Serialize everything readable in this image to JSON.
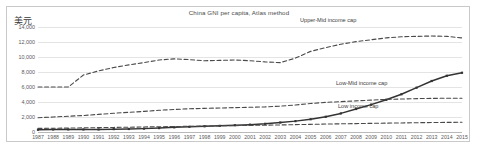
{
  "chart_data": {
    "type": "line",
    "title": "China GNI per capita, Atlas method",
    "xlabel": "",
    "ylabel": "美元",
    "ylim": [
      0,
      14000
    ],
    "ytick_labels": [
      "14,000",
      "12,000",
      "10,000",
      "8,000",
      "6,000",
      "4,000",
      "2,000",
      "0"
    ],
    "ytick_values": [
      14000,
      12000,
      10000,
      8000,
      6000,
      4000,
      2000,
      0
    ],
    "grid": true,
    "legend_position": "inline-annotations",
    "categories": [
      "1987",
      "1988",
      "1989",
      "1990",
      "1991",
      "1992",
      "1993",
      "1994",
      "1995",
      "1996",
      "1997",
      "1998",
      "1999",
      "2000",
      "2001",
      "2002",
      "2003",
      "2004",
      "2005",
      "2006",
      "2007",
      "2008",
      "2009",
      "2010",
      "2011",
      "2012",
      "2013",
      "2014",
      "2015"
    ],
    "series": [
      {
        "name": "China GNI per capita",
        "style": "solid-with-markers",
        "color": "#333333",
        "values": [
          300,
          340,
          350,
          340,
          340,
          380,
          400,
          450,
          520,
          620,
          700,
          760,
          820,
          900,
          980,
          1090,
          1260,
          1450,
          1700,
          2030,
          2480,
          3070,
          3650,
          4300,
          5030,
          5910,
          6800,
          7500,
          7900
        ]
      },
      {
        "name": "Upper-Mid income cap",
        "style": "dashed",
        "color": "#4a4a4a",
        "values": [
          6000,
          6000,
          6000,
          7600,
          8150,
          8600,
          8950,
          9250,
          9600,
          9750,
          9650,
          9500,
          9550,
          9600,
          9500,
          9350,
          9250,
          9850,
          10750,
          11250,
          11700,
          12050,
          12300,
          12550,
          12700,
          12750,
          12800,
          12750,
          12550
        ]
      },
      {
        "name": "Low-Mid income cap",
        "style": "dashed",
        "color": "#4a4a4a",
        "values": [
          1900,
          2000,
          2100,
          2200,
          2350,
          2500,
          2620,
          2750,
          2900,
          3000,
          3100,
          3150,
          3200,
          3250,
          3300,
          3350,
          3450,
          3600,
          3800,
          3950,
          4050,
          4150,
          4250,
          4350,
          4400,
          4450,
          4480,
          4500,
          4500
        ]
      },
      {
        "name": "Low income cap",
        "style": "dashed",
        "color": "#4a4a4a",
        "values": [
          480,
          500,
          520,
          550,
          580,
          610,
          640,
          670,
          700,
          730,
          760,
          790,
          820,
          850,
          880,
          910,
          940,
          980,
          1020,
          1060,
          1090,
          1120,
          1150,
          1180,
          1210,
          1240,
          1260,
          1280,
          1300
        ]
      }
    ],
    "annotations": [
      {
        "id": "upper-mid",
        "text": "Upper-Mid income cap"
      },
      {
        "id": "low-mid",
        "text": "Low-Mid income cap"
      },
      {
        "id": "low",
        "text": "Low income cap"
      }
    ]
  }
}
